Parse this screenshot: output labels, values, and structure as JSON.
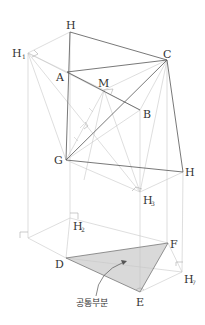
{
  "diagram": {
    "title": "",
    "colors": {
      "dark_line": "#555555",
      "light_line": "#c8c8c8",
      "shade": "#d9d9d9",
      "label": "#333333"
    },
    "points": {
      "H_top": {
        "label": "H",
        "x": 70,
        "y": 32
      },
      "H1": {
        "label": "H",
        "sub": "1",
        "x": 28,
        "y": 53
      },
      "C": {
        "label": "C",
        "x": 167,
        "y": 60
      },
      "A": {
        "label": "A",
        "x": 67,
        "y": 72
      },
      "M": {
        "label": "M",
        "x": 104,
        "y": 90
      },
      "B": {
        "label": "B",
        "x": 140,
        "y": 110
      },
      "G": {
        "label": "G",
        "x": 66,
        "y": 160
      },
      "H_right": {
        "label": "H",
        "x": 183,
        "y": 172
      },
      "H3": {
        "label": "H",
        "sub": "3",
        "x": 140,
        "y": 192
      },
      "H2": {
        "label": "H",
        "sub": "2",
        "x": 70,
        "y": 218
      },
      "D": {
        "label": "D",
        "x": 66,
        "y": 258
      },
      "F": {
        "label": "F",
        "x": 168,
        "y": 243
      },
      "E": {
        "label": "E",
        "x": 140,
        "y": 292
      },
      "H7": {
        "label": "H",
        "sub": "7",
        "x": 182,
        "y": 272
      }
    },
    "annotation": {
      "text": "공통부분",
      "meaning": "common part (shaded region)"
    }
  }
}
